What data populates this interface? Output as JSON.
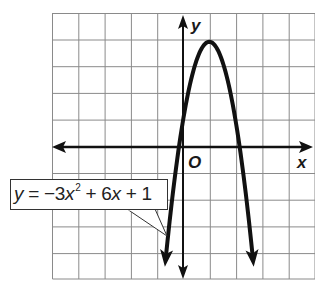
{
  "figure": {
    "type": "coordinate-graph",
    "axes": {
      "x_label": "x",
      "y_label": "y",
      "origin_label": "O"
    },
    "grid": {
      "columns_visible": 10,
      "rows_visible": 10,
      "x_range_visible": [
        -5,
        5
      ],
      "y_range_visible": [
        -5,
        5
      ],
      "unit_px": 26.3
    },
    "curve": {
      "equation_display": {
        "lhs": "y",
        "equals": "=",
        "term1_coef": "−3",
        "term1_var": "x",
        "term1_exp": "2",
        "op1": "+",
        "term2_coef": "6",
        "term2_var": "x",
        "op2": "+",
        "constant": "1"
      },
      "a": -3,
      "b": 6,
      "c": 1,
      "vertex": [
        1,
        4
      ],
      "y_intercept": 1,
      "roots_approx": [
        -0.15,
        2.15
      ],
      "color": "#111111"
    },
    "colors": {
      "grid": "#8a8a8a",
      "axes": "#111111",
      "background": "#ffffff"
    }
  }
}
